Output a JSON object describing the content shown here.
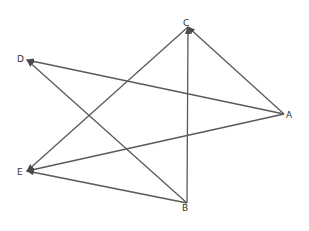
{
  "diagram": {
    "type": "directed-graph",
    "style": {
      "edge_color": "#5a5a5a",
      "label_color": "#333333",
      "background": "#ffffff"
    },
    "nodes": [
      {
        "id": "A",
        "label": "A",
        "x": 284,
        "y": 114,
        "label_x": 286,
        "label_y": 118
      },
      {
        "id": "B",
        "label": "B",
        "x": 187,
        "y": 203,
        "label_x": 182,
        "label_y": 211
      },
      {
        "id": "C",
        "label": "C",
        "x": 188,
        "y": 27,
        "label_x": 183,
        "label_y": 26
      },
      {
        "id": "D",
        "label": "D",
        "x": 27,
        "y": 60,
        "label_x": 17,
        "label_y": 62
      },
      {
        "id": "E",
        "label": "E",
        "x": 27,
        "y": 171,
        "label_x": 17,
        "label_y": 175
      }
    ],
    "edges": [
      {
        "from": "A",
        "to": "D"
      },
      {
        "from": "B",
        "to": "D"
      },
      {
        "from": "B",
        "to": "C"
      },
      {
        "from": "A",
        "to": "C"
      },
      {
        "from": "C",
        "to": "E"
      },
      {
        "from": "A",
        "to": "E"
      },
      {
        "from": "B",
        "to": "E"
      }
    ]
  }
}
